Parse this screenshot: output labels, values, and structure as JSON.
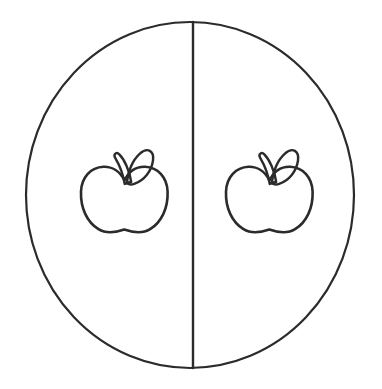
{
  "figure": {
    "background_color": "#ffffff",
    "stroke_color": "#2b2b2b",
    "width": 382,
    "height": 389,
    "style": "line-art outline, coloring page"
  },
  "shapes": {
    "outer_circle": {
      "name": "outer circle",
      "center_x": 190,
      "center_y": 195,
      "radius_x": 164,
      "radius_y": 173,
      "stroke_width": 2.2
    },
    "divider": {
      "name": "vertical dividing line",
      "x": 193,
      "y_top": 22,
      "y_bottom": 368,
      "stroke_width": 2.4
    }
  },
  "apples": [
    {
      "id": "left-apple",
      "label": "Left apple",
      "half": "left",
      "center_x": 124,
      "center_y": 196,
      "body_width": 87,
      "body_height": 82,
      "has_stem": true,
      "has_leaf": true,
      "leaf_direction": "upper-right"
    },
    {
      "id": "right-apple",
      "label": "Right apple",
      "half": "right",
      "center_x": 269,
      "center_y": 196,
      "body_width": 87,
      "body_height": 82,
      "has_stem": true,
      "has_leaf": true,
      "leaf_direction": "upper-right"
    }
  ],
  "counts": {
    "halves": 2,
    "apples_per_half": 1,
    "total_apples": 2
  }
}
